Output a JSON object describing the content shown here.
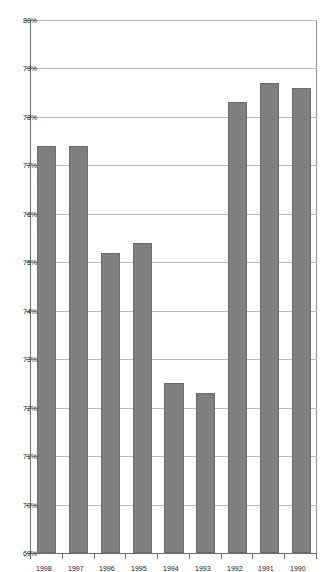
{
  "chart_data": {
    "type": "bar",
    "orientation": "horizontal",
    "title": "",
    "subtitle": "",
    "xlabel": "",
    "ylabel": "",
    "categories": [
      "1990",
      "1991",
      "1992",
      "1993",
      "1994",
      "1995",
      "1996",
      "1997",
      "1998"
    ],
    "values": [
      78.6,
      78.7,
      78.3,
      72.3,
      72.5,
      75.4,
      75.2,
      77.4,
      77.4
    ],
    "value_tick_labels": [
      "80%",
      "79%",
      "78%",
      "77%",
      "76%",
      "75%",
      "74%",
      "73%",
      "72%",
      "71%",
      "70%",
      "69%"
    ],
    "value_ticks": [
      80,
      79,
      78,
      77,
      76,
      75,
      74,
      73,
      72,
      71,
      70,
      69
    ],
    "xlim": [
      69,
      80
    ],
    "baseline": 69,
    "axis_direction": "descending",
    "grid": true,
    "legend": false,
    "legend_position": "none",
    "series": [
      {
        "name": "",
        "values": [
          78.6,
          78.7,
          78.3,
          72.3,
          72.5,
          75.4,
          75.2,
          77.4,
          77.4
        ]
      }
    ],
    "colors": {
      "bar_fill": "#7f7f7f",
      "bar_stroke": "#6a6a6a",
      "gridline": "#b9b9b9",
      "axis": "#6e6e6e",
      "background": "#ffffff",
      "text": "#1a1a1a"
    }
  },
  "axes": {
    "category_axis_name": "year-axis",
    "value_axis_name": "percent-axis"
  }
}
